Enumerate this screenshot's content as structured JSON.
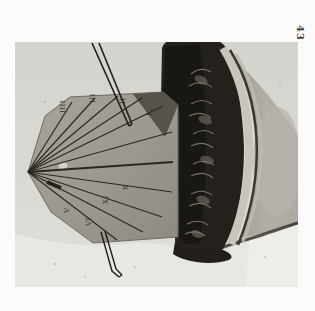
{
  "page_number": "43",
  "photo": {
    "dial_numerals": [
      {
        "text": "IIII"
      },
      {
        "text": "III"
      },
      {
        "text": "II"
      },
      {
        "text": "I"
      },
      {
        "text": "XI"
      },
      {
        "text": "X"
      },
      {
        "text": "VI"
      },
      {
        "text": "V"
      }
    ]
  },
  "colors": {
    "page": "#fcfbf9",
    "photo_background": "#d8d6d1",
    "dial_stone": "#a29e95",
    "carving_dark": "#24211d",
    "column_shaft": "#aba79f",
    "broken_plaster": "#e9e7e1",
    "hour_line_ink": "#2b2823",
    "plate_number_ink": "#3b3a38"
  }
}
